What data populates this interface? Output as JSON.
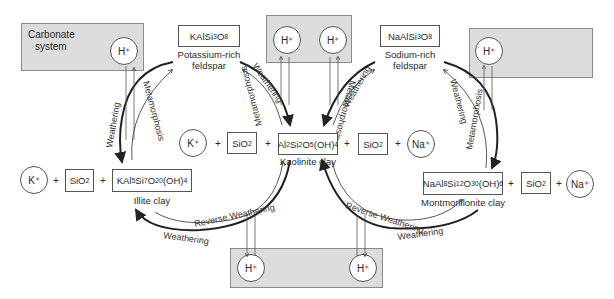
{
  "diagram": {
    "title": "",
    "carbonate_system": {
      "label_line1": "Carbonate",
      "label_line2": "system",
      "ion": "H⁺"
    },
    "reservoirs": {
      "top_middle": {
        "ions": [
          "H⁺",
          "H⁺"
        ]
      },
      "top_right": {
        "ions": [
          "H⁺"
        ]
      },
      "bottom_middle": {
        "ions": [
          "H⁺",
          "H⁺"
        ]
      }
    },
    "minerals": {
      "k_feldspar": {
        "formula_parts": [
          "KAlSi",
          "3",
          "O",
          "8"
        ],
        "name_line1": "Potassium-rich",
        "name_line2": "feldspar"
      },
      "na_feldspar": {
        "formula_parts": [
          "NaAlSi",
          "3",
          "O",
          "8"
        ],
        "name_line1": "Sodium-rich",
        "name_line2": "feldspar"
      },
      "kaolinite": {
        "formula": "Al2Si2O5(OH)4",
        "name": "Kaolinite clay"
      },
      "illite": {
        "formula": "KAl5Si7O20(OH)4",
        "name": "Illite clay"
      },
      "montmorillonite": {
        "formula": "NaAl8Si12O30(OH)6",
        "name": "Montmorillonite clay"
      }
    },
    "species": {
      "k_ion": "K⁺",
      "na_ion": "Na⁺",
      "silica": "SiO2",
      "plus": "+"
    },
    "process_labels": {
      "weathering": "Weathering",
      "metamorphosis": "Metamorphosis",
      "reverse_weathering": "Reverse Weathering"
    }
  }
}
